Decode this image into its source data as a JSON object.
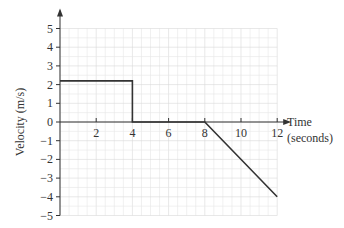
{
  "chart_data": {
    "type": "line",
    "title": "",
    "xlabel": "Time (seconds)",
    "xlabel_lines": [
      "Time",
      "(seconds)"
    ],
    "ylabel": "Velocity (m/s)",
    "x": [
      0,
      4,
      4,
      8,
      12
    ],
    "y": [
      2.2,
      2.2,
      0,
      0,
      -4
    ],
    "xlim": [
      0,
      12
    ],
    "ylim": [
      -5,
      5
    ],
    "xticks": [
      2,
      4,
      6,
      8,
      10,
      12
    ],
    "yticks": [
      5,
      4,
      3,
      2,
      1,
      0,
      -1,
      -2,
      -3,
      -4,
      -5
    ],
    "grid": true,
    "line_color": "#333333",
    "grid_color": "#e6e6e6"
  }
}
